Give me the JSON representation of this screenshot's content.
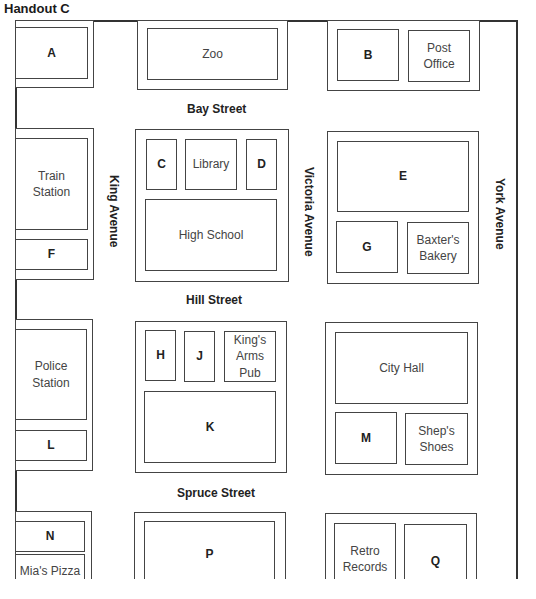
{
  "title": "Handout C",
  "streets": {
    "bay": "Bay Street",
    "hill": "Hill Street",
    "spruce": "Spruce Street",
    "king": "King Avenue",
    "victoria": "Victoria Avenue",
    "york": "York Avenue"
  },
  "lots": {
    "a": "A",
    "zoo": "Zoo",
    "b": "B",
    "post_office": "Post Office",
    "train_station": "Train Station",
    "f": "F",
    "c": "C",
    "library": "Library",
    "d": "D",
    "high_school": "High School",
    "e": "E",
    "g": "G",
    "baxters_bakery": "Baxter's Bakery",
    "police_station": "Police Station",
    "l": "L",
    "h": "H",
    "j": "J",
    "kings_arms_pub": "King's Arms Pub",
    "k": "K",
    "city_hall": "City Hall",
    "m": "M",
    "sheps_shoes": "Shep's Shoes",
    "n": "N",
    "mias_pizza": "Mia's Pizza",
    "p": "P",
    "retro_records": "Retro Records",
    "q": "Q"
  }
}
